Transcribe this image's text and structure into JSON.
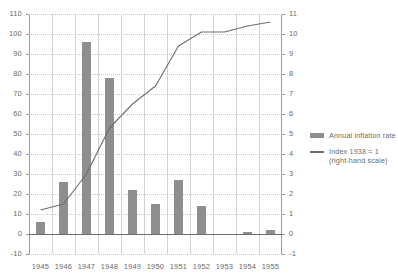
{
  "chart_data": {
    "type": "bar",
    "title": "",
    "xlabel": "",
    "ylabel": "",
    "categories": [
      "1945",
      "1946",
      "1947",
      "1948",
      "1949",
      "1950",
      "1951",
      "1952",
      "1953",
      "1954",
      "1955"
    ],
    "grid": true,
    "legend_position": "right",
    "left_axis": {
      "label": "",
      "ylim": [
        -10,
        110
      ],
      "step": 10,
      "ticks": [
        "110",
        "100",
        "90",
        "80",
        "70",
        "60",
        "50",
        "40",
        "30",
        "20",
        "10",
        "0",
        "-10"
      ]
    },
    "right_axis": {
      "label": "",
      "ylim": [
        -1,
        11
      ],
      "step": 1,
      "ticks": [
        "11",
        "10",
        "9",
        "8",
        "7",
        "6",
        "5",
        "4",
        "3",
        "2",
        "1",
        "0",
        "-1"
      ]
    },
    "series": [
      {
        "name": "Annual inflation rate",
        "type": "bar",
        "axis": "left",
        "color": "#8e8e8e",
        "values": [
          6,
          26,
          96,
          78,
          22,
          15,
          27,
          14,
          -0.5,
          1,
          2
        ]
      },
      {
        "name": "Index 1938 = 1 (right-hand scale)",
        "type": "line",
        "axis": "right",
        "color": "#6e6e6e",
        "values": [
          1.2,
          1.5,
          3.0,
          5.3,
          6.5,
          7.4,
          9.4,
          10.1,
          10.1,
          10.4,
          10.6
        ]
      }
    ]
  },
  "legend": {
    "items": [
      {
        "label": "Annual inflation rate",
        "sub": ""
      },
      {
        "label": "Index 1938 = 1",
        "sub": "(right-hand scale)"
      }
    ]
  },
  "colors": {
    "bar": "#8e8e8e",
    "line": "#6e6e6e",
    "grid": "#c8c8c8",
    "axis": "#9a9a9a",
    "text": "#6b6b6b"
  }
}
